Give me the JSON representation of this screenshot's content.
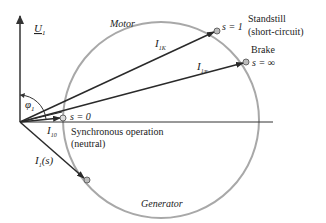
{
  "diagram": {
    "colors": {
      "axis": "#333333",
      "circle": "#a8a8a8",
      "vector": "#2a2a2a",
      "text": "#222222",
      "point_fill": "#bbbbbb"
    },
    "axes": {
      "voltage_label": "U",
      "voltage_subscript": "1",
      "angle_label": "φ",
      "angle_subscript": "1"
    },
    "regions": {
      "motor": "Motor",
      "generator": "Generator"
    },
    "points": [
      {
        "id": "s0",
        "slip_label": "s = 0",
        "description_line1": "Synchronous operation",
        "description_line2": "(neutral)"
      },
      {
        "id": "s1",
        "slip_label": "s = 1",
        "description_line1": "Standstill",
        "description_line2": "(short-circuit)"
      },
      {
        "id": "sinf",
        "slip_label": "s = ∞",
        "description_line1": "Brake"
      }
    ],
    "vectors": [
      {
        "id": "I10",
        "label": "I",
        "subscript": "10"
      },
      {
        "id": "I1K",
        "label": "I",
        "subscript": "1K"
      },
      {
        "id": "I1inf",
        "label": "I",
        "subscript": "1∞"
      },
      {
        "id": "I1s",
        "label": "I",
        "subscript": "1",
        "suffix": "(s)"
      }
    ]
  }
}
